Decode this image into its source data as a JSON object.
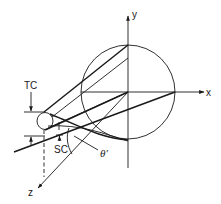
{
  "diagram": {
    "axes": {
      "x_label": "x",
      "y_label": "y",
      "z_label": "z"
    },
    "labels": {
      "tc": "TC",
      "sc": "SC",
      "theta": "θ′"
    },
    "colors": {
      "ink": "#1a1a1a",
      "background": "#ffffff"
    }
  }
}
